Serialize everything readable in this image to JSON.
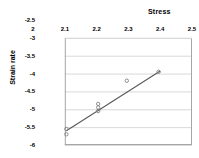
{
  "chart_data": {
    "type": "scatter",
    "title": "Stress",
    "xlabel": "Stress",
    "ylabel": "Strain rate",
    "xlim": [
      2,
      2.5
    ],
    "ylim": [
      -6,
      -2.5
    ],
    "plot_xlim": [
      2.1,
      2.5
    ],
    "plot_ylim": [
      -6,
      -3
    ],
    "grid": "horizontal",
    "legend": "none",
    "x_tick_labels": [
      "2",
      "2.1",
      "2.2",
      "2.3",
      "2.4",
      "2.5"
    ],
    "x_ticks": [
      2,
      2.1,
      2.2,
      2.3,
      2.4,
      2.5
    ],
    "y_tick_labels": [
      "-2.5",
      "-3",
      "-3.5",
      "-4",
      "-4.5",
      "-5",
      "-5.5",
      "-6"
    ],
    "y_ticks": [
      -2.5,
      -3,
      -3.5,
      -4,
      -4.5,
      -5,
      -5.5,
      -6
    ],
    "x_axis_position": "top",
    "series": [
      {
        "name": "Measurements",
        "marker": "open-circle",
        "color": "#808080",
        "points": [
          {
            "x": 2.105,
            "y": -5.55
          },
          {
            "x": 2.105,
            "y": -5.7
          },
          {
            "x": 2.205,
            "y": -4.85
          },
          {
            "x": 2.205,
            "y": -4.95
          },
          {
            "x": 2.205,
            "y": -5.05
          },
          {
            "x": 2.295,
            "y": -4.2
          },
          {
            "x": 2.395,
            "y": -3.95
          }
        ]
      }
    ],
    "trendline": {
      "name": "Fit line",
      "color": "#595959",
      "x_start": 2.105,
      "y_start": -5.6,
      "x_end": 2.4,
      "y_end": -3.93
    }
  },
  "axis_titles": {
    "top_title": "Stress",
    "left_title": "Strain rate"
  }
}
